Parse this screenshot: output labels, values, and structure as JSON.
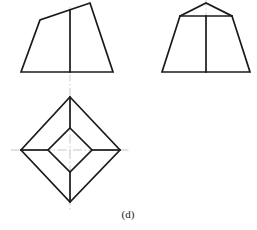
{
  "figure": {
    "caption": "(d)",
    "background_color": "#ffffff",
    "outline_color": "#1a1a1a",
    "centerline_color": "#b8b8b8",
    "outline_width": 1.6,
    "centerline_width": 0.7
  },
  "views": {
    "front_view": {
      "name": "front-view",
      "label": "front view",
      "outline_points": "21,72 40,20 90,3 113,72",
      "center_line": {
        "x": 70,
        "y1": 7,
        "y2": 86
      },
      "divider_line": {
        "x1": 70,
        "y1": 10,
        "x2": 70,
        "y2": 72
      }
    },
    "side_view": {
      "name": "side-view",
      "label": "side view",
      "outline_points": "162,72 180,16 232,16 250,72",
      "roof_points": "180,16 206,3 232,16",
      "center_line": {
        "x": 206,
        "y1": 0,
        "y2": 20
      },
      "divider_line": {
        "x1": 206,
        "y1": 16,
        "x2": 206,
        "y2": 72
      }
    },
    "top_view": {
      "name": "top-view",
      "label": "top view",
      "outer_diamond_points": "70,97 120,150 70,202 21,150",
      "inner_diamond_points": "70,128 92,150 70,172 48,150",
      "connector_lines": [
        {
          "x1": 70,
          "y1": 97,
          "x2": 70,
          "y2": 128
        },
        {
          "x1": 120,
          "y1": 150,
          "x2": 92,
          "y2": 150
        },
        {
          "x1": 70,
          "y1": 202,
          "x2": 70,
          "y2": 172
        },
        {
          "x1": 21,
          "y1": 150,
          "x2": 48,
          "y2": 150
        }
      ],
      "vertical_centerline": {
        "x": 70,
        "y1": 88,
        "y2": 212
      },
      "horizontal_centerline": {
        "y": 150,
        "x1": 11,
        "x2": 131
      }
    }
  },
  "caption_position": {
    "x": 128,
    "y": 218
  }
}
